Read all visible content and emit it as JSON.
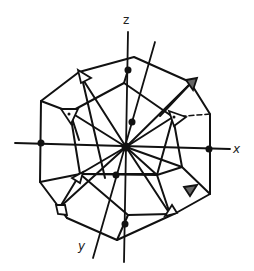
{
  "diagram": {
    "type": "polyhedron-projection-with-axes",
    "axes": {
      "z": {
        "label": "z"
      },
      "x": {
        "label": "x"
      },
      "y": {
        "label": "y"
      }
    },
    "colors": {
      "line": "#111111",
      "background": "#ffffff",
      "marker_fill": "#111111",
      "shaded_marker": "#555555"
    },
    "markers": {
      "filled_dots": 8,
      "open_triangles": 3,
      "filled_triangles": 5,
      "open_squares": 2
    }
  }
}
